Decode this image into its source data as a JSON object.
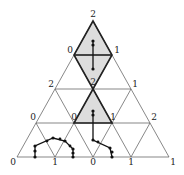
{
  "diagram": {
    "type": "triangular-subdivision",
    "labels": [
      {
        "id": "top",
        "text": "2",
        "x": 93,
        "y": 17
      },
      {
        "id": "r1-left",
        "text": "0",
        "x": 70,
        "y": 53
      },
      {
        "id": "r1-right",
        "text": "1",
        "x": 117,
        "y": 53
      },
      {
        "id": "r2-center",
        "text": "2",
        "x": 93,
        "y": 85
      },
      {
        "id": "r2-left",
        "text": "2",
        "x": 51,
        "y": 87
      },
      {
        "id": "r2-right",
        "text": "1",
        "x": 135,
        "y": 87
      },
      {
        "id": "r3-left",
        "text": "0",
        "x": 33,
        "y": 120
      },
      {
        "id": "r3-mid",
        "text": "0",
        "x": 74,
        "y": 120
      },
      {
        "id": "r3-mid2",
        "text": "1",
        "x": 113,
        "y": 120
      },
      {
        "id": "r3-right",
        "text": "2",
        "x": 154,
        "y": 120
      },
      {
        "id": "b0",
        "text": "0",
        "x": 13,
        "y": 165
      },
      {
        "id": "b1",
        "text": "1",
        "x": 55,
        "y": 165
      },
      {
        "id": "b2",
        "text": "0",
        "x": 93,
        "y": 165
      },
      {
        "id": "b3",
        "text": "1",
        "x": 131,
        "y": 165
      },
      {
        "id": "b4",
        "text": "1",
        "x": 173,
        "y": 165
      }
    ]
  }
}
